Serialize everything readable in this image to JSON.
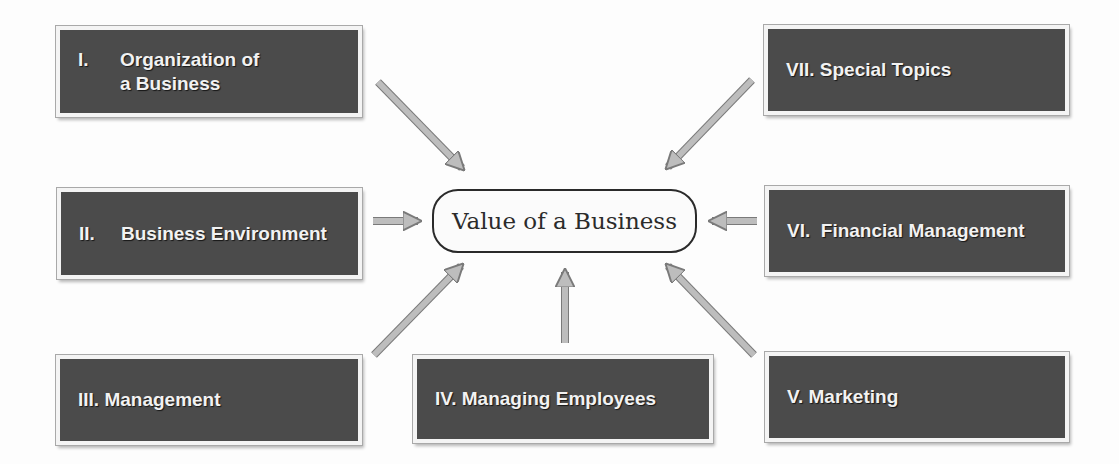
{
  "diagram": {
    "center": {
      "label": "Value of a Business"
    },
    "boxes": [
      {
        "numeral": "I.",
        "title_line1": "Organization of",
        "title_line2": "a Business"
      },
      {
        "numeral": "II.",
        "title": "Business Environment"
      },
      {
        "numeral": "III.",
        "title": "Management"
      },
      {
        "numeral": "IV.",
        "title": "Managing Employees"
      },
      {
        "numeral": "V.",
        "title": "Marketing"
      },
      {
        "numeral": "VI.",
        "title": "Financial Management"
      },
      {
        "numeral": "VII.",
        "title": "Special Topics"
      }
    ],
    "colors": {
      "box_fill": "#4b4b4b",
      "box_text": "#f2f2f2",
      "arrow_fill": "#bdbdbd",
      "arrow_stroke": "#7a7a7a",
      "pill_border": "#2a2a2a"
    }
  }
}
